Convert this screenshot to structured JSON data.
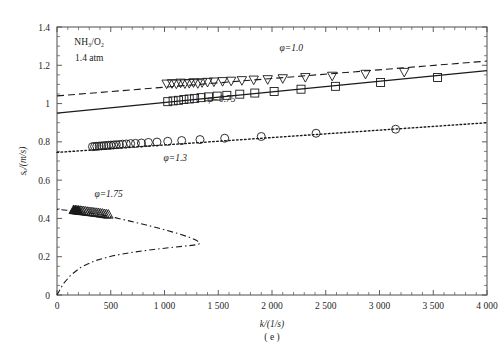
{
  "figure": {
    "panel_label": "( e )",
    "conditions": {
      "mixture": "NH3/O2",
      "mixture_display": "NH₃/O₂",
      "pressure": "1.4 atm"
    }
  },
  "chart_data": {
    "type": "scatter",
    "title": "",
    "subtitle": "",
    "xlabel": "k/(1/s)",
    "ylabel": "s_u/(m/s)",
    "ylabel_display": "sᵤ/(m/s)",
    "xlim": [
      0,
      4000
    ],
    "ylim": [
      0,
      1.4
    ],
    "xticks": [
      0,
      500,
      1000,
      1500,
      2000,
      2500,
      3000,
      3500,
      4000
    ],
    "xtick_labels": [
      "0",
      "500",
      "1 000",
      "1 500",
      "2 000",
      "2 500",
      "3 000",
      "3 500",
      "4 000"
    ],
    "yticks": [
      0,
      0.2,
      0.4,
      0.6,
      0.8,
      1.0,
      1.2,
      1.4
    ],
    "ytick_labels": [
      "0",
      "0.2",
      "0.4",
      "0.6",
      "0.8",
      "1",
      "1.2",
      "1.4"
    ],
    "xtick_minor_step": 100,
    "ytick_minor_step": 0.05,
    "grid": false,
    "legend_position": "inline-annotations",
    "annotations": [
      {
        "text": "NH₃/O₂",
        "x": 300,
        "y": 1.305
      },
      {
        "text": "1.4 atm",
        "x": 300,
        "y": 1.225
      },
      {
        "text": "φ=1.0",
        "x": 2180,
        "y": 1.275
      },
      {
        "text": "φ=0.75",
        "x": 1530,
        "y": 1.01
      },
      {
        "text": "φ=1.3",
        "x": 1100,
        "y": 0.7
      },
      {
        "text": "φ=1.75",
        "x": 480,
        "y": 0.51
      }
    ],
    "series": [
      {
        "name": "φ=1.0",
        "equivalence_ratio": 1.0,
        "marker": "triangle-down",
        "marker_fill": "open",
        "line_style": "dashed",
        "fit_endpoints": [
          [
            0,
            1.04
          ],
          [
            4000,
            1.222
          ]
        ],
        "x": [
          1020,
          1070,
          1110,
          1150,
          1190,
          1230,
          1270,
          1310,
          1350,
          1400,
          1460,
          1540,
          1620,
          1720,
          1830,
          1960,
          2100,
          2310,
          2560,
          2870,
          3230
        ],
        "y": [
          1.105,
          1.107,
          1.105,
          1.11,
          1.106,
          1.108,
          1.112,
          1.107,
          1.112,
          1.114,
          1.116,
          1.118,
          1.12,
          1.123,
          1.126,
          1.128,
          1.133,
          1.139,
          1.146,
          1.156,
          1.166
        ]
      },
      {
        "name": "φ=0.75",
        "equivalence_ratio": 0.75,
        "marker": "square",
        "marker_fill": "open",
        "line_style": "solid",
        "fit_endpoints": [
          [
            0,
            0.95
          ],
          [
            4000,
            1.172
          ]
        ],
        "x": [
          1030,
          1080,
          1130,
          1180,
          1230,
          1280,
          1340,
          1410,
          1490,
          1580,
          1700,
          1840,
          2020,
          2270,
          2590,
          3010,
          3540
        ],
        "y": [
          1.01,
          1.014,
          1.017,
          1.021,
          1.024,
          1.027,
          1.031,
          1.035,
          1.039,
          1.043,
          1.049,
          1.055,
          1.063,
          1.075,
          1.09,
          1.11,
          1.136
        ]
      },
      {
        "name": "φ=1.3",
        "equivalence_ratio": 1.3,
        "marker": "circle",
        "marker_fill": "open",
        "line_style": "dotted",
        "fit_endpoints": [
          [
            0,
            0.745
          ],
          [
            4000,
            0.9
          ]
        ],
        "x": [
          330,
          350,
          370,
          392,
          414,
          436,
          458,
          480,
          503,
          527,
          552,
          580,
          610,
          645,
          685,
          730,
          785,
          850,
          930,
          1030,
          1160,
          1330,
          1560,
          1900,
          2410,
          3150
        ],
        "y": [
          0.775,
          0.776,
          0.777,
          0.778,
          0.779,
          0.78,
          0.781,
          0.782,
          0.783,
          0.784,
          0.785,
          0.786,
          0.788,
          0.789,
          0.791,
          0.792,
          0.794,
          0.797,
          0.799,
          0.803,
          0.807,
          0.812,
          0.819,
          0.828,
          0.845,
          0.866
        ]
      },
      {
        "name": "φ=1.75",
        "equivalence_ratio": 1.75,
        "marker": "triangle-up",
        "marker_fill": "mixed",
        "line_style": "dash-dot",
        "curve_note": "C-shaped extinction branch, turning point near k=1320, s_u=0.26",
        "curve_points": [
          [
            0,
            0.0
          ],
          [
            60,
            0.06
          ],
          [
            130,
            0.105
          ],
          [
            230,
            0.148
          ],
          [
            360,
            0.18
          ],
          [
            520,
            0.205
          ],
          [
            700,
            0.223
          ],
          [
            900,
            0.238
          ],
          [
            1090,
            0.25
          ],
          [
            1230,
            0.258
          ],
          [
            1310,
            0.263
          ],
          [
            1330,
            0.27
          ],
          [
            1300,
            0.285
          ],
          [
            1230,
            0.302
          ],
          [
            1120,
            0.322
          ],
          [
            980,
            0.344
          ],
          [
            830,
            0.366
          ],
          [
            680,
            0.386
          ],
          [
            540,
            0.404
          ],
          [
            410,
            0.419
          ],
          [
            290,
            0.43
          ],
          [
            180,
            0.438
          ],
          [
            90,
            0.443
          ],
          [
            20,
            0.446
          ],
          [
            0,
            0.447
          ]
        ],
        "x": [
          155,
          170,
          185,
          200,
          215,
          230,
          245,
          262,
          280,
          298,
          316,
          334,
          352,
          370,
          388,
          406,
          424,
          442,
          460,
          478
        ],
        "y": [
          0.443,
          0.442,
          0.441,
          0.44,
          0.439,
          0.438,
          0.437,
          0.436,
          0.434,
          0.433,
          0.432,
          0.431,
          0.429,
          0.428,
          0.427,
          0.425,
          0.424,
          0.422,
          0.421,
          0.419
        ]
      }
    ]
  }
}
